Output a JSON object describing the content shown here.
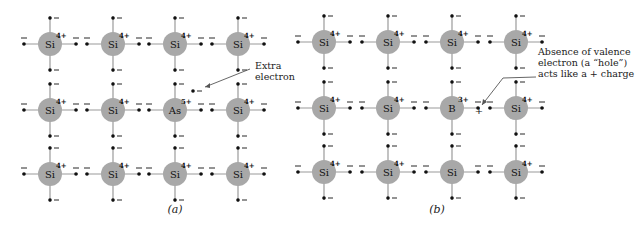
{
  "figure": {
    "panels": [
      {
        "id": "a",
        "caption": "(a)",
        "caption_pos": [
          175,
          213
        ],
        "cols_x": [
          50,
          113,
          175,
          238
        ],
        "rows_y": [
          44,
          110,
          174
        ],
        "atoms": [
          [
            {
              "symbol": "Si",
              "charge": "4+"
            },
            {
              "symbol": "Si",
              "charge": "4+"
            },
            {
              "symbol": "Si",
              "charge": "4+"
            },
            {
              "symbol": "Si",
              "charge": "4+"
            }
          ],
          [
            {
              "symbol": "Si",
              "charge": "4+"
            },
            {
              "symbol": "Si",
              "charge": "4+"
            },
            {
              "symbol": "As",
              "charge": "5+"
            },
            {
              "symbol": "Si",
              "charge": "4+"
            }
          ],
          [
            {
              "symbol": "Si",
              "charge": "4+"
            },
            {
              "symbol": "Si",
              "charge": "4+"
            },
            {
              "symbol": "Si",
              "charge": "4+"
            },
            {
              "symbol": "Si",
              "charge": "4+"
            }
          ]
        ],
        "annotation": {
          "lines": [
            "Extra",
            "electron"
          ],
          "text_pos": [
            255,
            72
          ],
          "extra_electron_pos": [
            193,
            91
          ],
          "arrow_from": [
            250,
            69
          ],
          "arrow_to": [
            205,
            87
          ]
        }
      },
      {
        "id": "b",
        "caption": "(b)",
        "caption_pos": [
          437,
          213
        ],
        "cols_x": [
          324,
          388,
          452,
          516
        ],
        "rows_y": [
          42,
          108,
          172
        ],
        "atoms": [
          [
            {
              "symbol": "Si",
              "charge": "4+"
            },
            {
              "symbol": "Si",
              "charge": "4+"
            },
            {
              "symbol": "Si",
              "charge": "4+"
            },
            {
              "symbol": "Si",
              "charge": "4+"
            }
          ],
          [
            {
              "symbol": "Si",
              "charge": "4+"
            },
            {
              "symbol": "Si",
              "charge": "4+"
            },
            {
              "symbol": "B",
              "charge": "3+"
            },
            {
              "symbol": "Si",
              "charge": "4+"
            }
          ],
          [
            {
              "symbol": "Si",
              "charge": "4+"
            },
            {
              "symbol": "Si",
              "charge": "4+"
            },
            {
              "symbol": "Si",
              "charge": ""
            },
            {
              "symbol": "Si",
              "charge": "4+"
            }
          ]
        ],
        "annotation": {
          "lines": [
            "Absence of valence",
            "electron (a “hole”)",
            "acts like a + charge"
          ],
          "text_pos": [
            538,
            69
          ],
          "hole_symbol": "+",
          "hole_pos": [
            479,
            110
          ],
          "arrow_from": [
            536,
            77
          ],
          "arrow_via": [
            503,
            78
          ],
          "arrow_to": [
            482,
            105
          ]
        }
      }
    ],
    "colors": {
      "atom_fill": "#a8a8a8",
      "bond": "#9a9a9a",
      "electron": "#111111"
    }
  }
}
